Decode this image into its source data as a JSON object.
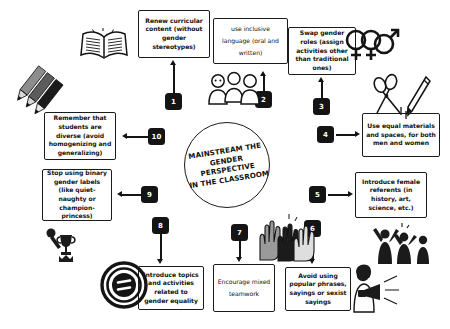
{
  "center": {
    "line1": "MAINSTREAM THE",
    "line2": "GENDER PERSPECTIVE",
    "line3": "IN THE CLASSROOM"
  },
  "steps": [
    {
      "number": "1",
      "text": "Renew curricular content (without gender stereotypes)"
    },
    {
      "number": "2",
      "text": "use inclusive language (oral and written)"
    },
    {
      "number": "3",
      "text": "Swap gender roles (assign activities other than traditional ones)"
    },
    {
      "number": "4",
      "text": "Use equal materials and spaces, for both men and women"
    },
    {
      "number": "5",
      "text": "Introduce female referents (in history, art, science, etc.)"
    },
    {
      "number": "6",
      "text": "Avoid using popular phrases, sayings or sexist sayings"
    },
    {
      "number": "7",
      "text": "Encourage mixed teamwork"
    },
    {
      "number": "8",
      "text": "Introduce topics and activities related to gender equality"
    },
    {
      "number": "9",
      "text": "Stop using binary gender labels (like quiet-naughty or champion-princess)"
    },
    {
      "number": "10",
      "text": "Remember that students are diverse (avoid homogenizing and generalizing)"
    }
  ],
  "icons": [
    {
      "name": "open-book-icon"
    },
    {
      "name": "colored-pencils-icon"
    },
    {
      "name": "speech-bubbles-icon"
    },
    {
      "name": "interlocking-gender-symbols-icon"
    },
    {
      "name": "scissors-and-pencil-icon"
    },
    {
      "name": "celebrating-women-silhouettes-icon"
    },
    {
      "name": "person-with-megaphone-icon"
    },
    {
      "name": "raised-diverse-hands-icon"
    },
    {
      "name": "trophy-and-crown-icon"
    },
    {
      "name": "equality-sign-seal-icon"
    }
  ],
  "colors": {
    "ink": "#141414",
    "background": "#ffffff",
    "badge_text": "#ffffff"
  }
}
